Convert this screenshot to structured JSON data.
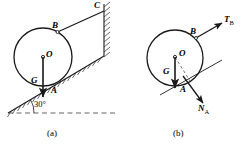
{
  "figure": {
    "stroke_color": "#1a1a1a",
    "hatch_color": "#2b2b2b",
    "dash_color": "#3a3a3a"
  },
  "panel_a": {
    "caption": "(a)",
    "labels": {
      "center": "O",
      "weight": "G",
      "contact": "A",
      "cord_tangent": "B",
      "anchor": "C",
      "angle": "30°"
    },
    "description": "Cylinder resting on a 30 degree incline, held by a cord from point B on the cylinder to point C on a vertical wall."
  },
  "panel_b": {
    "caption": "(b)",
    "labels": {
      "center": "O",
      "weight": "G",
      "contact": "A",
      "cord_point": "B",
      "tension": "T",
      "tension_sub": "B",
      "normal": "N",
      "normal_sub": "A"
    },
    "description": "Free body diagram of the cylinder showing weight G, cord tension T-B and normal reaction N-A."
  }
}
